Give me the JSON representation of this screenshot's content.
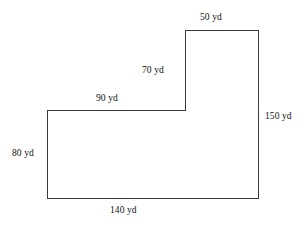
{
  "figure": {
    "unit": "yd",
    "stroke_color": "#3a3a3a",
    "fill_color": "#ffffff",
    "background_color": "#ffffff",
    "text_color": "#111111"
  },
  "chart_data": {
    "type": "diagram",
    "shape": "L-shaped hexagon (rectilinear polygon)",
    "title": "",
    "unit": "yd",
    "vertices_px": [
      [
        47,
        198
      ],
      [
        47,
        110
      ],
      [
        185,
        110
      ],
      [
        185,
        30
      ],
      [
        258,
        30
      ],
      [
        258,
        198
      ]
    ],
    "svg_path": "M 47 198 L 47 110 L 185 110 L 185 30 L 258 30 L 258 198 Z",
    "edges": [
      {
        "name": "top-right-edge",
        "label": "50 yd",
        "value": 50,
        "orientation": "horizontal"
      },
      {
        "name": "right-edge",
        "label": "150 yd",
        "value": 150,
        "orientation": "vertical"
      },
      {
        "name": "inner-vertical-edge",
        "label": "70 yd",
        "value": 70,
        "orientation": "vertical"
      },
      {
        "name": "inner-horizontal-edge",
        "label": "90 yd",
        "value": 90,
        "orientation": "horizontal"
      },
      {
        "name": "left-edge",
        "label": "80 yd",
        "value": 80,
        "orientation": "vertical"
      },
      {
        "name": "bottom-edge",
        "label": "140 yd",
        "value": 140,
        "orientation": "horizontal"
      }
    ]
  },
  "labels": {
    "top_right": "50 yd",
    "right_side": "150 yd",
    "inner_vertical": "70 yd",
    "inner_horizontal": "90 yd",
    "left_side": "80 yd",
    "bottom": "140 yd"
  }
}
